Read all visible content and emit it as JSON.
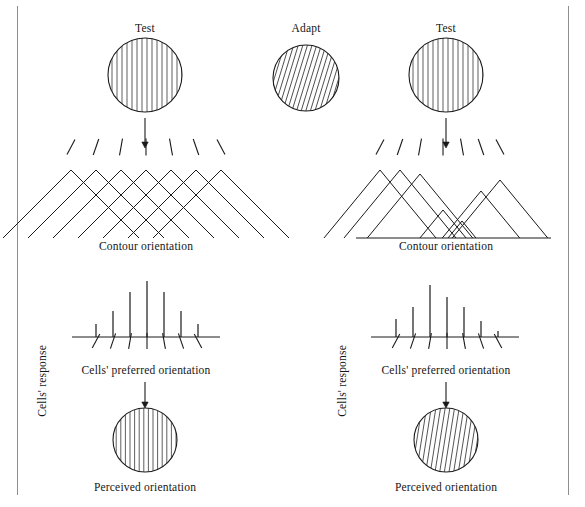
{
  "figure": {
    "title_hidden": "Tilt aftereffect: orientation-selective adaptation",
    "stroke_color": "#1a1a1a",
    "frame_color": "#8e8e8e"
  },
  "labels": {
    "test_left": "Test",
    "adapt": "Adapt",
    "test_right": "Test",
    "contour_orientation_left": "Contour orientation",
    "contour_orientation_right": "Contour orientation",
    "cells_response_left": "Cells' response",
    "cells_response_right": "Cells' response",
    "cells_preferred_left": "Cells' preferred orientation",
    "cells_preferred_right": "Cells' preferred orientation",
    "perceived_left": "Perceived orientation",
    "perceived_right": "Perceived orientation"
  },
  "gratings": {
    "test_left": {
      "name": "test-left",
      "cx": 145,
      "cy": 75,
      "r": 37,
      "tilt_deg": 0,
      "stripe_gap": 5.0
    },
    "adapt": {
      "name": "adapt",
      "cx": 306,
      "cy": 78,
      "r": 33,
      "tilt_deg": 17,
      "stripe_gap": 4.4
    },
    "test_right": {
      "name": "test-right",
      "cx": 446,
      "cy": 75,
      "r": 37,
      "tilt_deg": 0,
      "stripe_gap": 5.0
    },
    "perceived_left": {
      "name": "perceived-left",
      "cx": 145,
      "cy": 440,
      "r": 32,
      "tilt_deg": 0,
      "stripe_gap": 4.6
    },
    "perceived_right": {
      "name": "perceived-right",
      "cx": 446,
      "cy": 440,
      "r": 32,
      "tilt_deg": 9,
      "stripe_gap": 4.6
    }
  },
  "arrows": [
    {
      "name": "arrow-test-left-to-tuning",
      "x": 145,
      "y1": 118,
      "y2": 148
    },
    {
      "name": "arrow-test-right-to-tuning",
      "x": 446,
      "y1": 118,
      "y2": 148
    },
    {
      "name": "arrow-response-left-to-percept",
      "x": 145,
      "y1": 382,
      "y2": 408
    },
    {
      "name": "arrow-response-right-to-percept",
      "x": 446,
      "y1": 382,
      "y2": 408
    }
  ],
  "chart_data": [
    {
      "name": "tuning-curves-unadapted",
      "type": "line",
      "title": "Unadapted orientation tuning curves",
      "xlabel": "Contour orientation",
      "ylabel": "",
      "baseline_y": 238,
      "x_peaks": [
        71,
        96,
        121,
        146,
        171,
        196,
        221
      ],
      "half_width": 68,
      "heights": [
        68,
        68,
        68,
        68,
        68,
        68,
        68
      ],
      "tick_marks": {
        "y": 147,
        "length": 17,
        "angles_deg": [
          -28,
          -19,
          -10,
          0,
          10,
          19,
          28
        ]
      },
      "axis_visible": false
    },
    {
      "name": "tuning-curves-adapted",
      "type": "line",
      "title": "Adapted orientation tuning curves",
      "xlabel": "Contour orientation",
      "ylabel": "",
      "baseline_y": 238,
      "x_peaks": [
        380,
        400,
        420,
        443,
        462,
        481,
        500
      ],
      "half_width": 56,
      "heights": [
        68,
        68,
        64,
        28,
        17,
        47,
        58
      ],
      "tick_marks": {
        "y": 147,
        "length": 17,
        "angles_deg": [
          -28,
          -19,
          -10,
          0,
          10,
          19,
          28
        ]
      },
      "axis_visible": true,
      "axis_x0": 356,
      "axis_x1": 551
    },
    {
      "name": "response-histogram-unadapted",
      "type": "bar",
      "title": "Cells' response (unadapted)",
      "xlabel": "Cells' preferred orientation",
      "ylabel": "Cells' response",
      "baseline_y": 337,
      "axis_x0": 72,
      "axis_x1": 220,
      "x_bars": [
        96,
        113,
        130,
        147,
        164,
        181,
        198
      ],
      "values": [
        13,
        26,
        45,
        56,
        45,
        26,
        13
      ],
      "tick_marks": {
        "y": 341,
        "length": 16,
        "angles_deg": [
          -28,
          -19,
          -10,
          0,
          10,
          19,
          28
        ]
      }
    },
    {
      "name": "response-histogram-adapted",
      "type": "bar",
      "title": "Cells' response (adapted, peak shifted)",
      "xlabel": "Cells' preferred orientation",
      "ylabel": "Cells' response",
      "baseline_y": 337,
      "axis_x0": 371,
      "axis_x1": 519,
      "x_bars": [
        396,
        413,
        430,
        447,
        464,
        481,
        498
      ],
      "values": [
        18,
        30,
        52,
        40,
        30,
        16,
        6
      ],
      "tick_marks": {
        "y": 341,
        "length": 16,
        "angles_deg": [
          -28,
          -19,
          -10,
          0,
          10,
          19,
          28
        ]
      }
    }
  ]
}
